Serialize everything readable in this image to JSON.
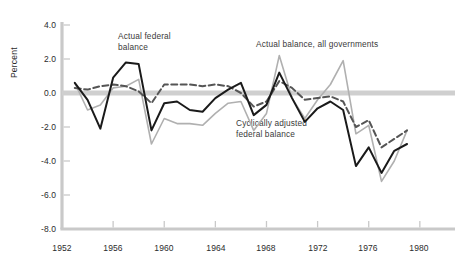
{
  "chart_data": {
    "type": "line",
    "title": "",
    "xlabel": "",
    "ylabel": "Percent",
    "xlim": [
      1952,
      1981
    ],
    "ylim": [
      -8.0,
      4.0
    ],
    "grid": false,
    "legend_position": "inline-annotations",
    "yticks": [
      "4.0",
      "2.0",
      "0.0",
      "-2.0",
      "-4.0",
      "-6.0",
      "-8.0"
    ],
    "ytick_values": [
      4.0,
      2.0,
      0.0,
      -2.0,
      -4.0,
      -6.0,
      -8.0
    ],
    "xticks": [
      "1952",
      "1956",
      "1960",
      "1964",
      "1968",
      "1972",
      "1976",
      "1980"
    ],
    "xtick_values": [
      1952,
      1956,
      1960,
      1964,
      1968,
      1972,
      1976,
      1980
    ],
    "zero_line": 0.0,
    "annotations": [
      {
        "id": "actual-federal-balance",
        "text": "Actual federal\nbalance",
        "x": 1956.3,
        "y": 3.4
      },
      {
        "id": "actual-balance-all-governments",
        "text": "Actual balance, all governments",
        "x": 1967.2,
        "y": 2.9
      },
      {
        "id": "cyclically-adjusted-federal-balance",
        "text": "Cyclically adjusted\nfederal balance",
        "x": 1965.6,
        "y": -1.6
      }
    ],
    "series": [
      {
        "name": "Actual federal balance",
        "style": "solid",
        "color": "#1a1a1a",
        "width": 2.0,
        "x": [
          1953,
          1954,
          1955,
          1956,
          1957,
          1958,
          1959,
          1960,
          1961,
          1962,
          1963,
          1964,
          1965,
          1966,
          1967,
          1968,
          1969,
          1970,
          1971,
          1972,
          1973,
          1974,
          1975,
          1976,
          1977,
          1978,
          1979
        ],
        "values": [
          0.6,
          -0.4,
          -2.1,
          0.9,
          1.8,
          1.7,
          -2.2,
          -0.6,
          -0.5,
          -1.0,
          -1.1,
          -0.3,
          0.2,
          0.6,
          -1.3,
          -0.7,
          1.2,
          -0.3,
          -1.7,
          -0.9,
          -0.5,
          -1.0,
          -4.3,
          -3.2,
          -4.7,
          -3.4,
          -3.0
        ]
      },
      {
        "name": "Cyclically adjusted federal balance",
        "style": "dashed",
        "color": "#555555",
        "width": 2.0,
        "x": [
          1953,
          1954,
          1955,
          1956,
          1957,
          1958,
          1959,
          1960,
          1961,
          1962,
          1963,
          1964,
          1965,
          1966,
          1967,
          1968,
          1969,
          1970,
          1971,
          1972,
          1973,
          1974,
          1975,
          1976,
          1977,
          1978,
          1979
        ],
        "values": [
          0.3,
          0.2,
          0.4,
          0.5,
          0.4,
          0.1,
          -0.6,
          0.5,
          0.5,
          0.5,
          0.4,
          0.5,
          0.4,
          0.0,
          -0.8,
          -0.5,
          0.7,
          0.3,
          -0.4,
          -0.3,
          -0.2,
          -0.5,
          -2.0,
          -1.6,
          -3.2,
          -2.7,
          -2.2
        ]
      },
      {
        "name": "Actual balance, all governments",
        "style": "solid",
        "color": "#b0b0b0",
        "width": 1.6,
        "x": [
          1953,
          1954,
          1955,
          1956,
          1957,
          1958,
          1959,
          1960,
          1961,
          1962,
          1963,
          1964,
          1965,
          1966,
          1967,
          1968,
          1969,
          1970,
          1971,
          1972,
          1973,
          1974,
          1975,
          1976,
          1977,
          1978,
          1979
        ],
        "values": [
          0.6,
          -1.0,
          -0.7,
          0.3,
          0.4,
          0.8,
          -3.0,
          -1.5,
          -1.8,
          -1.8,
          -1.9,
          -1.2,
          -0.6,
          -0.5,
          -2.2,
          -1.2,
          2.2,
          -0.3,
          -1.5,
          -0.4,
          0.5,
          1.9,
          -2.4,
          -1.9,
          -5.2,
          -4.0,
          -2.2
        ]
      }
    ]
  },
  "axes": {
    "ylabel": "Percent",
    "ytick_labels": [
      "4.0",
      "2.0",
      "0.0",
      "-2.0",
      "-4.0",
      "-6.0",
      "-8.0"
    ],
    "xtick_labels": [
      "1952",
      "1956",
      "1960",
      "1964",
      "1968",
      "1972",
      "1976",
      "1980"
    ]
  },
  "annotations": {
    "actual_federal_balance": "Actual federal\nbalance",
    "actual_balance_all_governments": "Actual balance, all governments",
    "cyclically_adjusted_federal_balance": "Cyclically adjusted\nfederal balance"
  },
  "colors": {
    "actual_federal": "#1a1a1a",
    "cyclically_adjusted": "#555555",
    "all_governments": "#b0b0b0",
    "axis": "#c9c9c9",
    "zero_band": "#cfcfcf"
  }
}
